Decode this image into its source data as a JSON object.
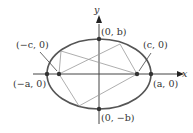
{
  "diagram": {
    "type": "ellipse-with-foci",
    "axis_labels": {
      "x": "x",
      "y": "y"
    },
    "points": {
      "vertex_left": "(−a, 0)",
      "vertex_right": "(a, 0)",
      "covertex_top": "(0, b)",
      "covertex_bottom": "(0, −b)",
      "focus_left": "(−c, 0)",
      "focus_right": "(c, 0)"
    },
    "colors": {
      "ellipse": "#555555",
      "axes": "#333333",
      "rays": "#999999",
      "points": "#333333"
    }
  }
}
